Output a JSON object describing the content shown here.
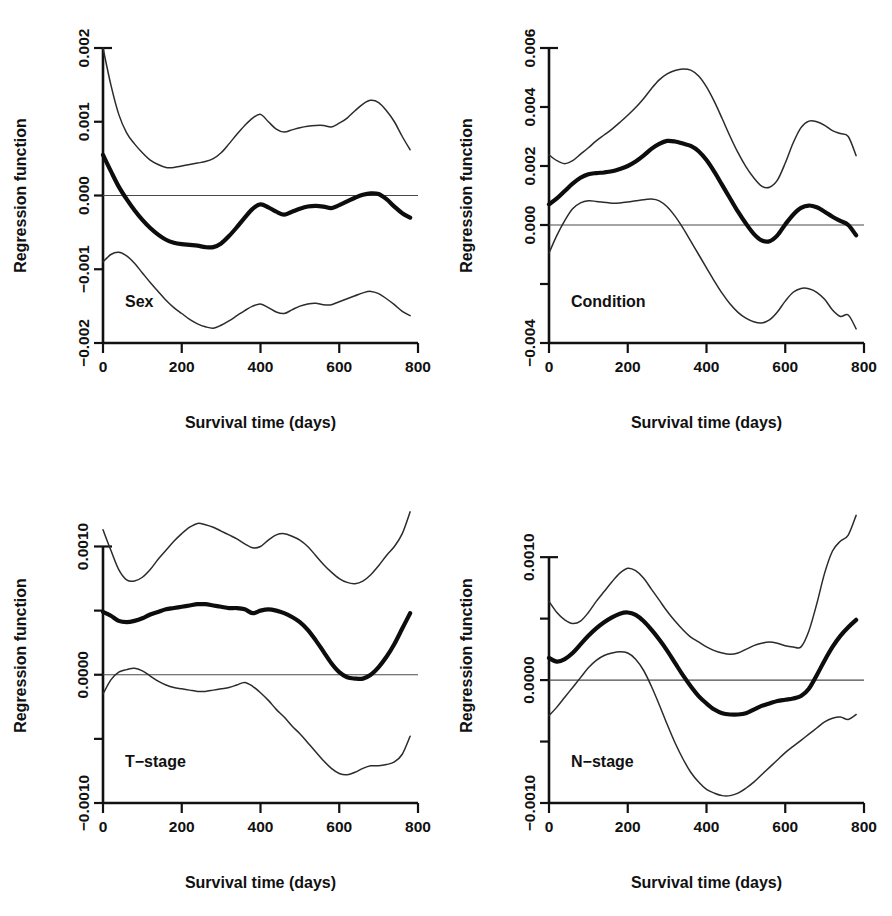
{
  "figure": {
    "background": "#ffffff",
    "accent": "#0d0d0d",
    "band_color": "#2b2b2b",
    "zero_line_color": "#4a4a4a",
    "width": 892,
    "height": 916,
    "panel_count": 4,
    "shared_xlabel": "Survival time (days)",
    "shared_ylabel": "Regression function"
  },
  "chart_data": [
    {
      "type": "line",
      "id": "sex",
      "title": "",
      "panel_label": "Sex",
      "xlabel": "Survival time (days)",
      "ylabel": "Regression function",
      "xlim": [
        0,
        800
      ],
      "ylim": [
        -0.002,
        0.002
      ],
      "xticks": [
        0,
        200,
        400,
        600,
        800
      ],
      "xticklabels": [
        "0",
        "200",
        "400",
        "600",
        "800"
      ],
      "yticks": [
        -0.002,
        -0.001,
        0.0,
        0.001,
        0.002
      ],
      "yticklabels": [
        "-0.002",
        "-0.001",
        "0.000",
        "0.001",
        "0.002"
      ],
      "grid": false,
      "legend": "none",
      "reference_line": 0.0,
      "x": [
        0,
        20,
        40,
        60,
        80,
        100,
        120,
        140,
        160,
        180,
        200,
        220,
        240,
        260,
        280,
        300,
        320,
        340,
        360,
        380,
        400,
        420,
        440,
        460,
        480,
        500,
        520,
        540,
        560,
        580,
        600,
        620,
        640,
        660,
        680,
        700,
        720,
        740,
        760,
        780
      ],
      "series": [
        {
          "name": "Estimate",
          "style": "thick",
          "values": [
            0.00055,
            0.00033,
            0.00012,
            -5e-05,
            -0.0002,
            -0.00033,
            -0.00044,
            -0.00053,
            -0.0006,
            -0.00064,
            -0.00066,
            -0.00067,
            -0.00068,
            -0.0007,
            -0.0007,
            -0.00065,
            -0.00055,
            -0.00043,
            -0.0003,
            -0.00018,
            -0.00012,
            -0.00016,
            -0.00022,
            -0.00026,
            -0.00022,
            -0.00018,
            -0.00015,
            -0.00014,
            -0.00015,
            -0.00017,
            -0.00013,
            -8e-05,
            -3e-05,
            1e-05,
            3e-05,
            2e-05,
            -5e-05,
            -0.00015,
            -0.00024,
            -0.0003
          ]
        },
        {
          "name": "Upper confidence limit",
          "style": "thin",
          "values": [
            0.002,
            0.0015,
            0.0011,
            0.00085,
            0.0007,
            0.00058,
            0.00048,
            0.00042,
            0.00038,
            0.00038,
            0.0004,
            0.00042,
            0.00044,
            0.00046,
            0.0005,
            0.00058,
            0.0007,
            0.00083,
            0.00095,
            0.00105,
            0.0011,
            0.001,
            0.0009,
            0.00086,
            0.00089,
            0.00092,
            0.00094,
            0.00095,
            0.00095,
            0.00093,
            0.00098,
            0.00105,
            0.00115,
            0.00124,
            0.00129,
            0.00126,
            0.00115,
            0.001,
            0.0008,
            0.00062
          ]
        },
        {
          "name": "Lower confidence limit",
          "style": "thin",
          "values": [
            -0.0009,
            -0.0008,
            -0.00077,
            -0.00082,
            -0.00092,
            -0.00105,
            -0.00118,
            -0.0013,
            -0.00142,
            -0.00152,
            -0.0016,
            -0.00168,
            -0.00174,
            -0.00178,
            -0.0018,
            -0.00176,
            -0.0017,
            -0.00163,
            -0.00156,
            -0.0015,
            -0.00147,
            -0.00152,
            -0.00158,
            -0.0016,
            -0.00155,
            -0.0015,
            -0.00147,
            -0.00146,
            -0.00148,
            -0.00148,
            -0.00144,
            -0.0014,
            -0.00136,
            -0.00132,
            -0.0013,
            -0.00133,
            -0.0014,
            -0.00148,
            -0.00157,
            -0.00163
          ]
        }
      ]
    },
    {
      "type": "line",
      "id": "condition",
      "title": "",
      "panel_label": "Condition",
      "xlabel": "Survival time (days)",
      "ylabel": "Regression function",
      "xlim": [
        0,
        800
      ],
      "ylim": [
        -0.004,
        0.006
      ],
      "xticks": [
        0,
        200,
        400,
        600,
        800
      ],
      "xticklabels": [
        "0",
        "200",
        "400",
        "600",
        "800"
      ],
      "yticks": [
        -0.004,
        -0.002,
        0.0,
        0.002,
        0.004,
        0.006
      ],
      "yticklabels": [
        "-0.004",
        "",
        "0.000",
        "0.002",
        "0.004",
        "0.006"
      ],
      "grid": false,
      "legend": "none",
      "reference_line": 0.0,
      "x": [
        0,
        20,
        40,
        60,
        80,
        100,
        120,
        140,
        160,
        180,
        200,
        220,
        240,
        260,
        280,
        300,
        320,
        340,
        360,
        380,
        400,
        420,
        440,
        460,
        480,
        500,
        520,
        540,
        560,
        580,
        600,
        620,
        640,
        660,
        680,
        700,
        720,
        740,
        760,
        780
      ],
      "series": [
        {
          "name": "Estimate",
          "style": "thick",
          "values": [
            0.0007,
            0.0009,
            0.00115,
            0.0014,
            0.0016,
            0.00172,
            0.00176,
            0.00178,
            0.00182,
            0.0019,
            0.002,
            0.00215,
            0.00235,
            0.00258,
            0.00275,
            0.00285,
            0.00283,
            0.00276,
            0.00268,
            0.0025,
            0.0022,
            0.0018,
            0.00135,
            0.0009,
            0.00045,
            5e-05,
            -0.0003,
            -0.00052,
            -0.00055,
            -0.00035,
            2e-05,
            0.00035,
            0.00058,
            0.00066,
            0.0006,
            0.00045,
            0.00028,
            0.00014,
            0.0,
            -0.00035
          ]
        },
        {
          "name": "Upper confidence limit",
          "style": "thin",
          "values": [
            0.00238,
            0.00218,
            0.00208,
            0.00218,
            0.0024,
            0.00262,
            0.00285,
            0.00305,
            0.00325,
            0.00348,
            0.00372,
            0.00398,
            0.00428,
            0.00462,
            0.00492,
            0.00512,
            0.00524,
            0.00529,
            0.00525,
            0.00505,
            0.00468,
            0.00418,
            0.0036,
            0.003,
            0.00245,
            0.00198,
            0.0016,
            0.00132,
            0.00128,
            0.00152,
            0.0021,
            0.00278,
            0.0033,
            0.00352,
            0.0035,
            0.00338,
            0.0032,
            0.0031,
            0.003,
            0.00235
          ]
        },
        {
          "name": "Lower confidence limit",
          "style": "thin",
          "values": [
            -0.00095,
            -0.00035,
            0.00015,
            0.00055,
            0.00075,
            0.00082,
            0.0008,
            0.00077,
            0.00074,
            0.00075,
            0.00078,
            0.00082,
            0.00086,
            0.00088,
            0.00082,
            0.00062,
            0.0003,
            -0.0001,
            -0.00055,
            -0.001,
            -0.00145,
            -0.0019,
            -0.00232,
            -0.00268,
            -0.00296,
            -0.00316,
            -0.00328,
            -0.00332,
            -0.00322,
            -0.00295,
            -0.00258,
            -0.00228,
            -0.00215,
            -0.00216,
            -0.00228,
            -0.00252,
            -0.00288,
            -0.0031,
            -0.00305,
            -0.00352
          ]
        }
      ]
    },
    {
      "type": "line",
      "id": "t-stage",
      "title": "",
      "panel_label": "T−stage",
      "xlabel": "Survival time (days)",
      "ylabel": "Regression function",
      "xlim": [
        0,
        800
      ],
      "ylim": [
        -0.001,
        0.0013
      ],
      "xticks": [
        0,
        200,
        400,
        600,
        800
      ],
      "xticklabels": [
        "0",
        "200",
        "400",
        "600",
        "800"
      ],
      "yticks": [
        -0.001,
        -0.0005,
        0.0,
        0.0005,
        0.001
      ],
      "yticklabels": [
        "-0.0010",
        "",
        "0.0000",
        "",
        "0.0010"
      ],
      "grid": false,
      "legend": "none",
      "reference_line": 0.0,
      "x": [
        0,
        20,
        40,
        60,
        80,
        100,
        120,
        140,
        160,
        180,
        200,
        220,
        240,
        260,
        280,
        300,
        320,
        340,
        360,
        380,
        400,
        420,
        440,
        460,
        480,
        500,
        520,
        540,
        560,
        580,
        600,
        620,
        640,
        660,
        680,
        700,
        720,
        740,
        760,
        780
      ],
      "series": [
        {
          "name": "Estimate",
          "style": "thick",
          "values": [
            0.00049,
            0.00046,
            0.00042,
            0.00041,
            0.00042,
            0.00044,
            0.00047,
            0.00049,
            0.00051,
            0.00052,
            0.00053,
            0.00054,
            0.00055,
            0.00055,
            0.00054,
            0.00053,
            0.00052,
            0.00052,
            0.00051,
            0.00048,
            0.0005,
            0.00051,
            0.0005,
            0.00048,
            0.00045,
            0.00041,
            0.00035,
            0.00027,
            0.00018,
            9e-05,
            2e-05,
            -2e-05,
            -3e-05,
            -3e-05,
            0.0,
            6e-05,
            0.00014,
            0.00024,
            0.00036,
            0.00048
          ]
        },
        {
          "name": "Upper confidence limit",
          "style": "thin",
          "values": [
            0.00113,
            0.00097,
            0.00082,
            0.00074,
            0.00073,
            0.00076,
            0.00082,
            0.0009,
            0.00097,
            0.00104,
            0.0011,
            0.00115,
            0.00118,
            0.00117,
            0.00115,
            0.00112,
            0.00109,
            0.00106,
            0.00102,
            0.00099,
            0.001,
            0.00105,
            0.00109,
            0.0011,
            0.00108,
            0.00105,
            0.001,
            0.00093,
            0.00086,
            0.0008,
            0.00075,
            0.00072,
            0.00071,
            0.00073,
            0.00078,
            0.00085,
            0.00093,
            0.001,
            0.0011,
            0.00127
          ]
        },
        {
          "name": "Lower confidence limit",
          "style": "thin",
          "values": [
            -0.00015,
            -4e-05,
            2e-05,
            4e-05,
            5e-05,
            3e-05,
            -1e-05,
            -5e-05,
            -8e-05,
            -0.0001,
            -0.00011,
            -0.00012,
            -0.00013,
            -0.00013,
            -0.00012,
            -0.00011,
            -0.0001,
            -8e-05,
            -6e-05,
            -9e-05,
            -0.00014,
            -0.0002,
            -0.00027,
            -0.00033,
            -0.0004,
            -0.00046,
            -0.00053,
            -0.0006,
            -0.00067,
            -0.00073,
            -0.00077,
            -0.00078,
            -0.00076,
            -0.00073,
            -0.00071,
            -0.00071,
            -0.0007,
            -0.00068,
            -0.00062,
            -0.00048
          ]
        }
      ]
    },
    {
      "type": "line",
      "id": "n-stage",
      "title": "",
      "panel_label": "N−stage",
      "xlabel": "Survival time (days)",
      "ylabel": "Regression function",
      "xlim": [
        0,
        800
      ],
      "ylim": [
        -0.001,
        0.0014
      ],
      "xticks": [
        0,
        200,
        400,
        600,
        800
      ],
      "xticklabels": [
        "0",
        "200",
        "400",
        "600",
        "800"
      ],
      "yticks": [
        -0.001,
        -0.0005,
        0.0,
        0.0005,
        0.001
      ],
      "yticklabels": [
        "-0.0010",
        "",
        "0.0000",
        "",
        "0.0010"
      ],
      "grid": false,
      "legend": "none",
      "reference_line": 0.0,
      "x": [
        0,
        20,
        40,
        60,
        80,
        100,
        120,
        140,
        160,
        180,
        200,
        220,
        240,
        260,
        280,
        300,
        320,
        340,
        360,
        380,
        400,
        420,
        440,
        460,
        480,
        500,
        520,
        540,
        560,
        580,
        600,
        620,
        640,
        660,
        680,
        700,
        720,
        740,
        760,
        780
      ],
      "series": [
        {
          "name": "Estimate",
          "style": "thick",
          "values": [
            0.00018,
            0.00015,
            0.00017,
            0.00022,
            0.00029,
            0.00036,
            0.00042,
            0.00047,
            0.00051,
            0.00054,
            0.00055,
            0.00053,
            0.00048,
            0.00041,
            0.00033,
            0.00024,
            0.00014,
            4e-05,
            -5e-05,
            -0.00013,
            -0.00019,
            -0.00024,
            -0.00027,
            -0.00028,
            -0.00028,
            -0.00027,
            -0.00024,
            -0.00021,
            -0.00019,
            -0.00017,
            -0.00016,
            -0.00015,
            -0.00013,
            -7e-05,
            4e-05,
            0.00016,
            0.00027,
            0.00036,
            0.00043,
            0.00049
          ]
        },
        {
          "name": "Upper confidence limit",
          "style": "thin",
          "values": [
            0.00064,
            0.00055,
            0.00049,
            0.00046,
            0.00048,
            0.00055,
            0.00064,
            0.00072,
            0.0008,
            0.00087,
            0.00091,
            0.00089,
            0.00083,
            0.00074,
            0.00065,
            0.00056,
            0.00048,
            0.00041,
            0.00035,
            0.00031,
            0.00027,
            0.00024,
            0.00022,
            0.00021,
            0.00022,
            0.00025,
            0.00028,
            0.0003,
            0.00031,
            0.0003,
            0.00028,
            0.00027,
            0.00027,
            0.0004,
            0.00062,
            0.00087,
            0.00105,
            0.00113,
            0.00118,
            0.00134
          ]
        },
        {
          "name": "Lower confidence limit",
          "style": "thin",
          "values": [
            -0.00029,
            -0.00022,
            -0.00014,
            -6e-05,
            2e-05,
            0.0001,
            0.00016,
            0.0002,
            0.00022,
            0.00023,
            0.00022,
            0.00017,
            8e-05,
            -5e-05,
            -0.0002,
            -0.00036,
            -0.00051,
            -0.00064,
            -0.00075,
            -0.00083,
            -0.00089,
            -0.00092,
            -0.00094,
            -0.00094,
            -0.00092,
            -0.00088,
            -0.00083,
            -0.00077,
            -0.00071,
            -0.00065,
            -0.00059,
            -0.00054,
            -0.00049,
            -0.00044,
            -0.00039,
            -0.00034,
            -0.00031,
            -0.0003,
            -0.00032,
            -0.00028
          ]
        }
      ]
    }
  ],
  "panels": [
    {
      "label": "Sex",
      "left": 0,
      "top": 0
    },
    {
      "label": "Condition",
      "left": 446,
      "top": 0
    },
    {
      "label": "T−stage",
      "left": 0,
      "top": 460
    },
    {
      "label": "N−stage",
      "left": 446,
      "top": 460
    }
  ]
}
